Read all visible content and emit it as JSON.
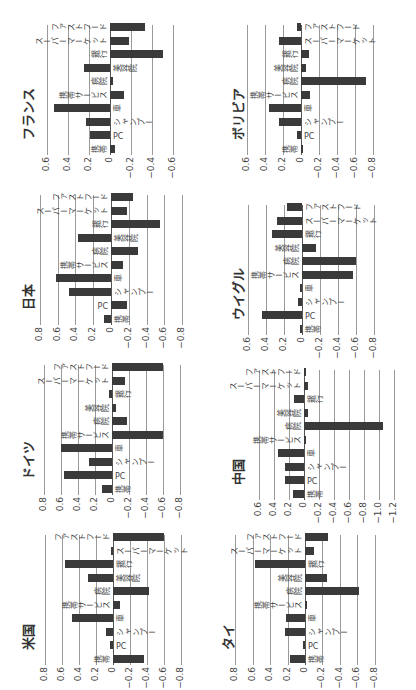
{
  "chart_data": [
    {
      "type": "bar",
      "title": "フランス",
      "ylim": [
        -0.6,
        0.6
      ],
      "ticks": [
        0.6,
        0.4,
        0.2,
        0,
        -0.2,
        -0.4,
        -0.6
      ],
      "categories": [
        "携帯",
        "PC",
        "シャンプー",
        "車",
        "携帯サービス",
        "病院",
        "美容院",
        "銀行",
        "スーパーマーケット",
        "ファストフード"
      ],
      "values": [
        -0.05,
        0.19,
        0.23,
        0.53,
        -0.13,
        -0.03,
        0.25,
        -0.5,
        -0.18,
        -0.33
      ]
    },
    {
      "type": "bar",
      "title": "ボリビア",
      "ylim": [
        -0.8,
        0.6
      ],
      "ticks": [
        0.6,
        0.4,
        0.2,
        0,
        -0.2,
        -0.4,
        -0.6,
        -0.8
      ],
      "categories": [
        "携帯",
        "PC",
        "シャンプー",
        "車",
        "携帯サービス",
        "病院",
        "美容院",
        "銀行",
        "スーパーマーケット",
        "ファストフード"
      ],
      "values": [
        -0.02,
        0.05,
        0.25,
        0.36,
        -0.1,
        -0.72,
        -0.05,
        -0.09,
        0.25,
        0.05
      ]
    },
    {
      "type": "bar",
      "title": "日本",
      "ylim": [
        -0.8,
        0.8
      ],
      "ticks": [
        0.8,
        0.6,
        0.4,
        0.2,
        0,
        -0.2,
        -0.4,
        -0.6,
        -0.8
      ],
      "categories": [
        "携帯",
        "PC",
        "シャンプー",
        "車",
        "携帯サービス",
        "病院",
        "美容院",
        "銀行",
        "スーパーマーケット",
        "ファストフード"
      ],
      "values": [
        0.08,
        -0.18,
        0.47,
        0.62,
        -0.13,
        -0.3,
        0.37,
        -0.55,
        -0.18,
        -0.25
      ]
    },
    {
      "type": "bar",
      "title": "ウイグル",
      "ylim": [
        -0.8,
        0.6
      ],
      "ticks": [
        0.6,
        0.4,
        0.2,
        0,
        -0.2,
        -0.4,
        -0.6,
        -0.8
      ],
      "categories": [
        "携帯",
        "PC",
        "シャンプー",
        "車",
        "携帯サービス",
        "病院",
        "美容院",
        "銀行",
        "スーパーマーケット",
        "ファストフード"
      ],
      "values": [
        0.01,
        0.45,
        0.05,
        0.0,
        -0.57,
        -0.6,
        -0.15,
        0.33,
        0.28,
        0.17
      ]
    },
    {
      "type": "bar",
      "title": "ドイツ",
      "ylim": [
        -0.8,
        0.8
      ],
      "ticks": [
        0.8,
        0.6,
        0.4,
        0.2,
        0,
        -0.2,
        -0.4,
        -0.6,
        -0.8
      ],
      "categories": [
        "携帯",
        "PC",
        "シャンプー",
        "車",
        "携帯サービス",
        "病院",
        "美容院",
        "銀行",
        "スーパーマーケット",
        "ファストフード"
      ],
      "values": [
        0.12,
        0.57,
        0.27,
        0.6,
        -0.6,
        -0.18,
        -0.05,
        0.03,
        -0.15,
        -0.6
      ]
    },
    {
      "type": "bar",
      "title": "中国",
      "ylim": [
        -1.2,
        0.6
      ],
      "ticks": [
        0.6,
        0.4,
        0.2,
        0,
        -0.2,
        -0.4,
        -0.6,
        -0.8,
        -1.0,
        -1.2
      ],
      "categories": [
        "携帯",
        "PC",
        "シャンプー",
        "車",
        "携帯サービス",
        "病院",
        "美容院",
        "銀行",
        "スーパーマーケット",
        "ファストフード"
      ],
      "values": [
        0.15,
        0.25,
        0.25,
        0.35,
        -0.01,
        -1.05,
        -0.05,
        0.13,
        -0.05,
        -0.02
      ]
    },
    {
      "type": "bar",
      "title": "米国",
      "ylim": [
        -0.8,
        0.8
      ],
      "ticks": [
        0.8,
        0.6,
        0.4,
        0.2,
        0,
        -0.2,
        -0.4,
        -0.6,
        -0.8
      ],
      "categories": [
        "携帯",
        "PC",
        "シャンプー",
        "車",
        "携帯サービス",
        "病院",
        "美容院",
        "銀行",
        "スーパーマーケット",
        "ファストフード"
      ],
      "values": [
        -0.37,
        0.04,
        0.08,
        0.48,
        -0.08,
        -0.42,
        0.29,
        0.57,
        0.02,
        -0.6
      ]
    },
    {
      "type": "bar",
      "title": "タイ",
      "ylim": [
        -0.8,
        0.8
      ],
      "ticks": [
        0.8,
        0.6,
        0.4,
        0.2,
        0,
        -0.2,
        -0.4,
        -0.6,
        -0.8
      ],
      "categories": [
        "携帯",
        "PC",
        "シャンプー",
        "車",
        "携帯サービス",
        "病院",
        "美容院",
        "銀行",
        "スーパーマーケット",
        "ファストフード"
      ],
      "values": [
        0.17,
        0.0,
        0.23,
        0.22,
        -0.01,
        -0.62,
        -0.25,
        0.57,
        -0.1,
        -0.27
      ]
    }
  ],
  "layout": {
    "panels": [
      {
        "left": 0,
        "top": 175,
        "zeroX": 110,
        "unit": 105
      },
      {
        "left": 210,
        "top": 175,
        "zeroX": 301,
        "unit": 90
      },
      {
        "left": 0,
        "top": 345,
        "zeroX": 111,
        "unit": 89
      },
      {
        "left": 210,
        "top": 355,
        "zeroX": 302,
        "unit": 90
      },
      {
        "left": 0,
        "top": 515,
        "zeroX": 112,
        "unit": 85
      },
      {
        "left": 210,
        "top": 520,
        "zeroX": 304,
        "unit": 75
      },
      {
        "left": 0,
        "top": 685,
        "zeroX": 113,
        "unit": 85
      },
      {
        "left": 200,
        "top": 685,
        "zeroX": 305,
        "unit": 87
      }
    ]
  }
}
